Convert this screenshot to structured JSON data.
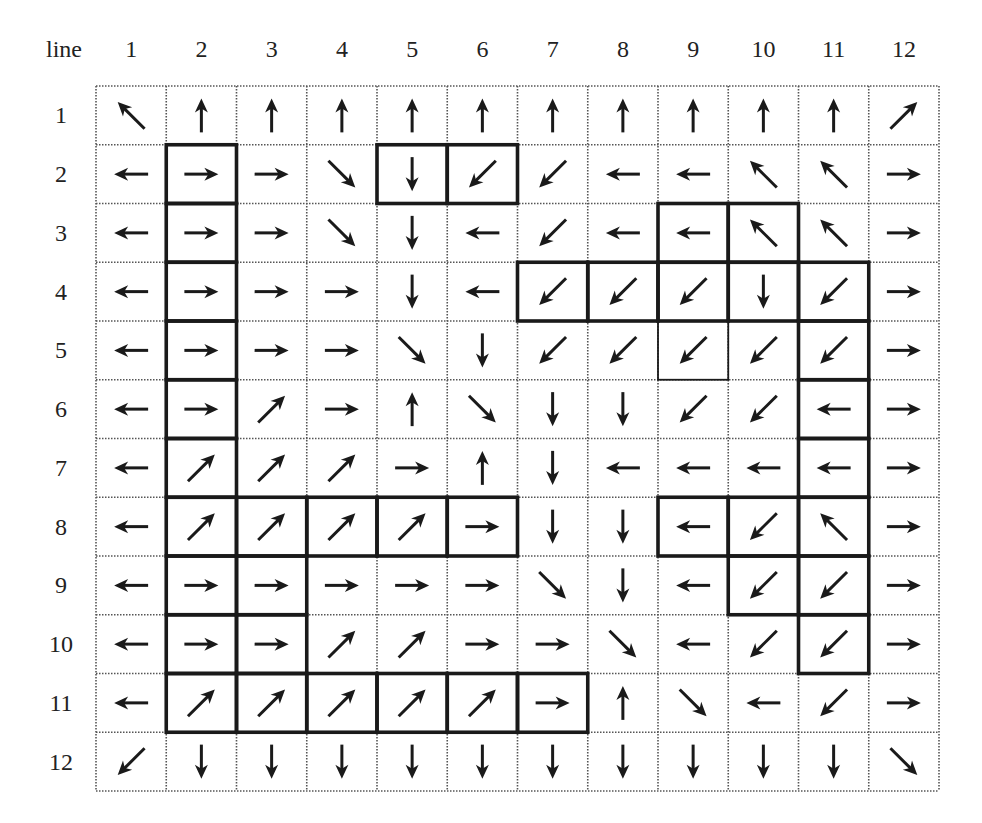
{
  "corner_label": "line",
  "column_labels": [
    "1",
    "2",
    "3",
    "4",
    "5",
    "6",
    "7",
    "8",
    "9",
    "10",
    "11",
    "12"
  ],
  "row_labels": [
    "1",
    "2",
    "3",
    "4",
    "5",
    "6",
    "7",
    "8",
    "9",
    "10",
    "11",
    "12"
  ],
  "arrow_legend": {
    "N": "up-arrow",
    "S": "down-arrow",
    "E": "right-arrow",
    "W": "left-arrow",
    "NE": "up-right-arrow",
    "NW": "up-left-arrow",
    "SE": "down-right-arrow",
    "SW": "down-left-arrow"
  },
  "grid": [
    [
      "NW",
      "N",
      "N",
      "N",
      "N",
      "N",
      "N",
      "N",
      "N",
      "N",
      "N",
      "NE"
    ],
    [
      "W",
      "E",
      "E",
      "SE",
      "S",
      "SW",
      "SW",
      "W",
      "W",
      "NW",
      "NW",
      "E"
    ],
    [
      "W",
      "E",
      "E",
      "SE",
      "S",
      "W",
      "SW",
      "W",
      "W",
      "NW",
      "NW",
      "E"
    ],
    [
      "W",
      "E",
      "E",
      "E",
      "S",
      "W",
      "SW",
      "SW",
      "SW",
      "S",
      "SW",
      "E"
    ],
    [
      "W",
      "E",
      "E",
      "E",
      "SE",
      "S",
      "SW",
      "SW",
      "SW",
      "SW",
      "SW",
      "E"
    ],
    [
      "W",
      "E",
      "NE",
      "E",
      "N",
      "SE",
      "S",
      "S",
      "SW",
      "SW",
      "W",
      "E"
    ],
    [
      "W",
      "NE",
      "NE",
      "NE",
      "E",
      "N",
      "S",
      "W",
      "W",
      "W",
      "W",
      "E"
    ],
    [
      "W",
      "NE",
      "NE",
      "NE",
      "NE",
      "E",
      "S",
      "S",
      "W",
      "SW",
      "NW",
      "E"
    ],
    [
      "W",
      "E",
      "E",
      "E",
      "E",
      "E",
      "SE",
      "S",
      "W",
      "SW",
      "SW",
      "E"
    ],
    [
      "W",
      "E",
      "E",
      "NE",
      "NE",
      "E",
      "E",
      "SE",
      "W",
      "SW",
      "SW",
      "E"
    ],
    [
      "W",
      "NE",
      "NE",
      "NE",
      "NE",
      "NE",
      "E",
      "N",
      "SE",
      "W",
      "SW",
      "E"
    ],
    [
      "SW",
      "S",
      "S",
      "S",
      "S",
      "S",
      "S",
      "S",
      "S",
      "S",
      "S",
      "SE"
    ]
  ],
  "bold_cells": [
    [
      2,
      2
    ],
    [
      3,
      2
    ],
    [
      4,
      2
    ],
    [
      5,
      2
    ],
    [
      6,
      2
    ],
    [
      7,
      2
    ],
    [
      8,
      2
    ],
    [
      9,
      2
    ],
    [
      10,
      2
    ],
    [
      11,
      2
    ],
    [
      2,
      5
    ],
    [
      2,
      6
    ],
    [
      3,
      9
    ],
    [
      3,
      10
    ],
    [
      4,
      7
    ],
    [
      4,
      8
    ],
    [
      4,
      9
    ],
    [
      4,
      10
    ],
    [
      4,
      11
    ],
    [
      5,
      11
    ],
    [
      6,
      11
    ],
    [
      7,
      11
    ],
    [
      8,
      11
    ],
    [
      9,
      11
    ],
    [
      10,
      11
    ],
    [
      8,
      3
    ],
    [
      8,
      4
    ],
    [
      8,
      5
    ],
    [
      8,
      6
    ],
    [
      9,
      3
    ],
    [
      10,
      3
    ],
    [
      11,
      3
    ],
    [
      11,
      4
    ],
    [
      11,
      5
    ],
    [
      11,
      6
    ],
    [
      11,
      7
    ],
    [
      8,
      9
    ],
    [
      8,
      10
    ],
    [
      9,
      10
    ]
  ],
  "thin_box_cells": [
    [
      5,
      9
    ]
  ],
  "colors": {
    "line": "#1a1a1a",
    "grid_dots": "#555555",
    "background": "#ffffff"
  }
}
